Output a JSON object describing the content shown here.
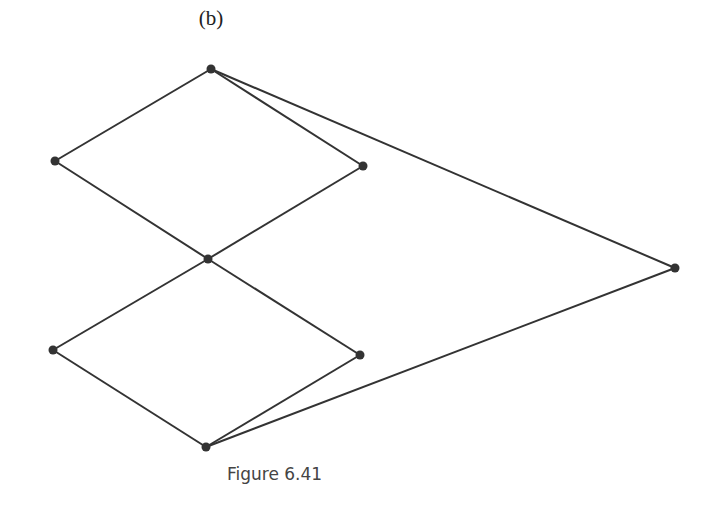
{
  "figure": {
    "panel_label": "(b)",
    "caption": "Figure 6.41",
    "colors": {
      "edge": "#333333",
      "node": "#333333",
      "background": "#ffffff"
    },
    "nodes": [
      {
        "id": "top",
        "x": 211,
        "y": 69
      },
      {
        "id": "left-upper",
        "x": 55,
        "y": 161
      },
      {
        "id": "right-upper",
        "x": 363,
        "y": 166
      },
      {
        "id": "middle",
        "x": 208,
        "y": 259
      },
      {
        "id": "far-right",
        "x": 675,
        "y": 268
      },
      {
        "id": "left-lower",
        "x": 53,
        "y": 350
      },
      {
        "id": "right-lower",
        "x": 360,
        "y": 355
      },
      {
        "id": "bottom",
        "x": 206,
        "y": 447
      }
    ],
    "edges": [
      [
        "top",
        "left-upper"
      ],
      [
        "top",
        "right-upper"
      ],
      [
        "top",
        "far-right"
      ],
      [
        "left-upper",
        "middle"
      ],
      [
        "right-upper",
        "middle"
      ],
      [
        "middle",
        "left-lower"
      ],
      [
        "middle",
        "right-lower"
      ],
      [
        "left-lower",
        "bottom"
      ],
      [
        "right-lower",
        "bottom"
      ],
      [
        "bottom",
        "far-right"
      ]
    ]
  }
}
